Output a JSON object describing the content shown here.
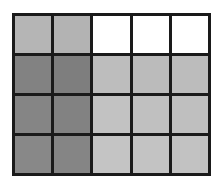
{
  "grid": {
    "rows": 4,
    "cols": 5,
    "border_color": "#1a1a1a",
    "cells": [
      [
        "#b5b5b5",
        "#b3b3b3",
        "#ffffff",
        "#ffffff",
        "#ffffff"
      ],
      [
        "#828282",
        "#7e7e7e",
        "#bdbdbd",
        "#bbbbbb",
        "#bcbcbc"
      ],
      [
        "#858585",
        "#828282",
        "#c2c2c2",
        "#c0c0c0",
        "#bfbfbf"
      ],
      [
        "#888888",
        "#858585",
        "#c4c4c4",
        "#c3c3c3",
        "#c2c2c2"
      ]
    ]
  }
}
